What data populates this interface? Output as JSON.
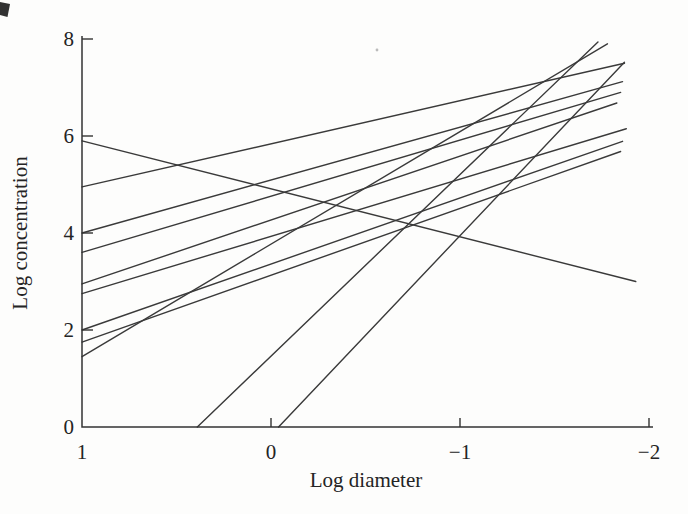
{
  "figure": {
    "background": "#fdfdfc",
    "ink_color": "#3a3a3a",
    "axis_color": "#333333",
    "text_color": "#242424",
    "scan_artifacts": {
      "corner_mark": "dark page-edge mark, top-left corner",
      "speck": "faint dust speck near top middle"
    }
  },
  "chart_data": {
    "type": "line",
    "title": "",
    "xlabel": "Log diameter",
    "ylabel": "Log concentration",
    "grid": false,
    "legend": "none",
    "x_axis": {
      "range": [
        1,
        -2
      ],
      "reversed": true,
      "ticks": [
        {
          "value": 1,
          "label": "1"
        },
        {
          "value": 0,
          "label": "0"
        },
        {
          "value": -1,
          "label": "−1"
        },
        {
          "value": -2,
          "label": "−2"
        }
      ]
    },
    "y_axis": {
      "range": [
        0,
        8
      ],
      "ticks": [
        {
          "value": 0,
          "label": "0"
        },
        {
          "value": 2,
          "label": "2"
        },
        {
          "value": 4,
          "label": "4"
        },
        {
          "value": 6,
          "label": "6"
        },
        {
          "value": 8,
          "label": "8"
        }
      ]
    },
    "series": [
      {
        "name": "line-a-descending",
        "points": [
          [
            1,
            5.9
          ],
          [
            -1.93,
            3.0
          ]
        ]
      },
      {
        "name": "line-b",
        "points": [
          [
            1,
            4.95
          ],
          [
            -1.87,
            7.5
          ]
        ]
      },
      {
        "name": "line-c",
        "points": [
          [
            1,
            4.0
          ],
          [
            -1.86,
            7.12
          ]
        ]
      },
      {
        "name": "line-d",
        "points": [
          [
            1,
            3.6
          ],
          [
            -1.85,
            6.9
          ]
        ]
      },
      {
        "name": "line-e",
        "points": [
          [
            1,
            2.95
          ],
          [
            -1.83,
            6.68
          ]
        ]
      },
      {
        "name": "line-f",
        "points": [
          [
            1,
            2.75
          ],
          [
            -1.88,
            6.15
          ]
        ]
      },
      {
        "name": "line-g",
        "points": [
          [
            1,
            2.0
          ],
          [
            -1.86,
            5.89
          ]
        ]
      },
      {
        "name": "line-h",
        "points": [
          [
            1,
            1.75
          ],
          [
            -1.85,
            5.68
          ]
        ]
      },
      {
        "name": "line-i-steep",
        "points": [
          [
            1,
            1.45
          ],
          [
            -1.78,
            7.9
          ]
        ]
      },
      {
        "name": "line-j-steep",
        "points": [
          [
            0.39,
            0
          ],
          [
            -1.73,
            7.94
          ]
        ]
      },
      {
        "name": "line-k-steep",
        "points": [
          [
            -0.04,
            0
          ],
          [
            -1.87,
            7.52
          ]
        ]
      }
    ]
  }
}
